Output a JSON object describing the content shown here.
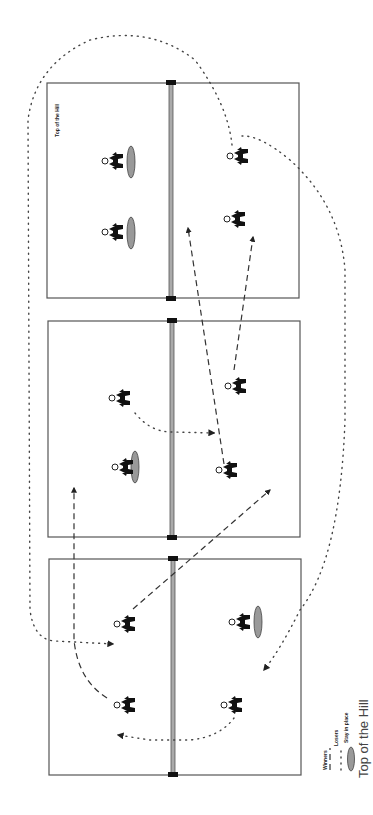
{
  "diagram": {
    "court_label": "Top of the Hill",
    "caption": "Top of the Hill",
    "legend": {
      "winners": "Winners",
      "losers": "Losers",
      "stay": "Stay in place"
    },
    "colors": {
      "court_line": "#555555",
      "net": "#aaaaaa",
      "stay_marker": "#999999",
      "player": "#111111"
    },
    "courts": [
      {
        "id": 1,
        "players": 4,
        "stay_in_place": 2
      },
      {
        "id": 2,
        "players": 4,
        "stay_in_place": 1
      },
      {
        "id": 3,
        "players": 4,
        "stay_in_place": 1
      }
    ]
  }
}
